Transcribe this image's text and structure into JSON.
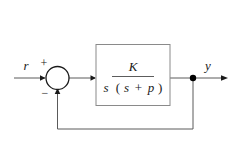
{
  "diagram": {
    "type": "control-system-block-diagram",
    "background_color": "#ffffff",
    "line_color": "#5a5a5a",
    "text_color": "#1a1a1a",
    "box_border_color": "#8a8a8a",
    "input": {
      "label": "r",
      "name": "reference-input"
    },
    "output": {
      "label": "y",
      "name": "system-output"
    },
    "summing_junction": {
      "name": "summing-junction",
      "positive_sign": "+",
      "negative_sign": "−",
      "positive_input_from": "r",
      "negative_input_from": "y"
    },
    "plant_block": {
      "name": "plant-transfer-function",
      "numerator": "K",
      "denominator_first": "s",
      "denominator_open_paren": "(",
      "denominator_second": "s",
      "denominator_operator": "+",
      "denominator_third": "p",
      "denominator_close_paren": ")",
      "expression": "K / ( s (s + p) )"
    },
    "feedback_path": {
      "name": "feedback-path",
      "gain": "1",
      "description": "unity feedback from output node back to summing junction"
    },
    "takeoff_node": {
      "name": "output-takeoff-node"
    }
  }
}
